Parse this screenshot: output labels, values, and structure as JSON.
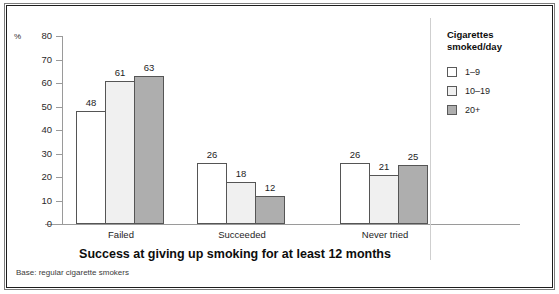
{
  "chart_data": {
    "type": "bar",
    "title": "Success at giving up smoking for at least 12 months",
    "xlabel": "",
    "ylabel": "%",
    "ylim": [
      0,
      80
    ],
    "yticks": [
      0,
      10,
      20,
      30,
      40,
      50,
      60,
      70,
      80
    ],
    "grid": false,
    "legend_position": "right",
    "legend_title": "Cigarettes\nsmoked/day",
    "categories": [
      "Failed",
      "Succeeded",
      "Never tried"
    ],
    "series": [
      {
        "name": "1–9",
        "values": [
          48,
          26,
          26
        ],
        "color": "#ffffff"
      },
      {
        "name": "10–19",
        "values": [
          61,
          18,
          21
        ],
        "color": "#f0f0f0"
      },
      {
        "name": "20+",
        "values": [
          63,
          12,
          25
        ],
        "color": "#aeaeae"
      }
    ],
    "base_note": "Base: regular cigarette smokers"
  }
}
